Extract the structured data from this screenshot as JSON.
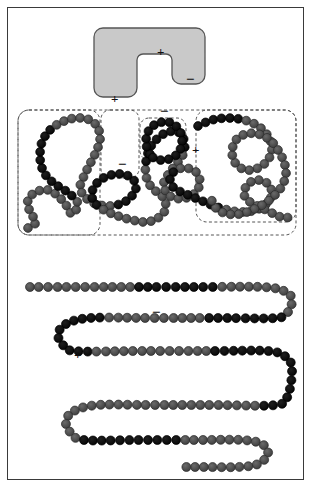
{
  "figure": {
    "background_color": "#ffffff",
    "frame_color": "#3a3a3a",
    "panels": [
      "substrate",
      "collapsed-chain",
      "extended-chain"
    ]
  },
  "substrate": {
    "name": "notched-rounded-substrate",
    "fill_color": "#c9c9c9",
    "stroke_color": "#555555",
    "charges": [
      {
        "label": "+",
        "x": 157,
        "y": 45
      },
      {
        "label": "−",
        "x": 186,
        "y": 72
      },
      {
        "label": "+",
        "x": 111,
        "y": 92
      }
    ]
  },
  "collapsed_chain": {
    "name": "collapsed-bead-chain",
    "bead_color": "#4d4d4d",
    "charged_bead_color": "#0d0d0d",
    "bead_stroke": "#1c1c1c",
    "dashed_boxes": [
      {
        "name": "domain-box-left",
        "x": 18,
        "y": 110,
        "w": 82,
        "h": 125
      },
      {
        "name": "domain-box-narrow",
        "x": 101,
        "y": 110,
        "w": 38,
        "h": 68
      },
      {
        "name": "domain-box-small-loop",
        "x": 140,
        "y": 118,
        "w": 46,
        "h": 42
      },
      {
        "name": "domain-box-right",
        "x": 196,
        "y": 110,
        "w": 100,
        "h": 112
      },
      {
        "name": "domain-box-wide-bottom",
        "x": 18,
        "y": 110,
        "w": 278,
        "h": 125
      }
    ],
    "charges": [
      {
        "label": "−",
        "x": 160,
        "y": 104
      },
      {
        "label": "−",
        "x": 118,
        "y": 157
      },
      {
        "label": "+",
        "x": 192,
        "y": 143
      }
    ]
  },
  "extended_chain": {
    "name": "extended-serpentine-chain",
    "bead_color": "#4d4d4d",
    "charged_bead_color": "#0d0d0d",
    "bead_stroke": "#1c1c1c",
    "row_count": 5,
    "charges": [
      {
        "label": "−",
        "x": 152,
        "y": 305
      },
      {
        "label": "+",
        "x": 74,
        "y": 348
      },
      {
        "label": "−",
        "x": 243,
        "y": 345
      }
    ]
  },
  "chart_data": {
    "type": "diagram",
    "xlabel": "",
    "ylabel": "",
    "legend": [
      {
        "name": "neutral-bead",
        "color": "#4d4d4d"
      },
      {
        "name": "charged-bead",
        "color": "#0d0d0d"
      },
      {
        "name": "substrate",
        "color": "#c9c9c9"
      }
    ],
    "annotations": [
      "+",
      "−",
      "+",
      "−",
      "−",
      "+",
      "−",
      "+",
      "−"
    ]
  }
}
